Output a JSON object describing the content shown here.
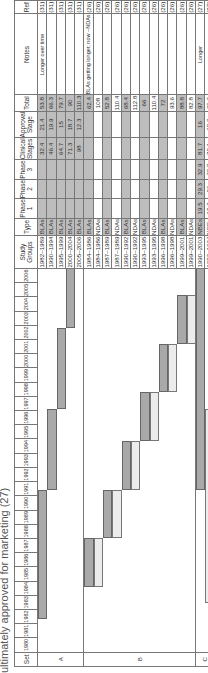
{
  "title": "ultimately approved for marketing (27)",
  "headers": {
    "set": "Set",
    "study_groups": "Study Groups",
    "type": "Type",
    "phase1": "Phase 1",
    "phase2": "Phase 2",
    "phase3": "Phase 3",
    "clinical": "Clinical Stages",
    "approval": "Approval Stage",
    "total": "Total",
    "notes": "Notes",
    "ref": "Ref"
  },
  "years": [
    "1980",
    "1981",
    "1982",
    "1983",
    "1984",
    "1985",
    "1986",
    "1987",
    "1988",
    "1989",
    "1990",
    "1991",
    "1992",
    "1993",
    "1994",
    "1995",
    "1996",
    "1997",
    "1998",
    "1999",
    "2000",
    "2001",
    "2002",
    "2003",
    "2004",
    "2005",
    "2006"
  ],
  "sets": [
    {
      "label": "A",
      "rows": 5
    },
    {
      "label": "B",
      "rows": 12
    },
    {
      "label": "C",
      "rows": 2
    }
  ],
  "rows": [
    {
      "set": "A",
      "group": "1982–1989",
      "type": "BLAs",
      "p1": "",
      "p2": "",
      "p3": "",
      "clinical": "32.4",
      "approval": "21.4",
      "total": "53.8",
      "notes": "Longer over time",
      "ref": "(31)",
      "shade": true
    },
    {
      "set": "A",
      "group": "1990–1994",
      "type": "BLAs",
      "p1": "",
      "p2": "",
      "p3": "",
      "clinical": "46.4",
      "approval": "19.9",
      "total": "66.3",
      "notes": "",
      "ref": "(31)",
      "shade": true
    },
    {
      "set": "A",
      "group": "1995–1999",
      "type": "BLAs",
      "p1": "",
      "p2": "",
      "p3": "",
      "clinical": "64.7",
      "approval": "15",
      "total": "79.7",
      "notes": "",
      "ref": "(31)",
      "shade": true
    },
    {
      "set": "A",
      "group": "2000–2004",
      "type": "BLAs",
      "p1": "",
      "p2": "",
      "p3": "",
      "clinical": "71.3",
      "approval": "18.7",
      "total": "90",
      "notes": "",
      "ref": "(31)",
      "shade": true
    },
    {
      "set": "A",
      "group": "2005–2006",
      "type": "BLAs",
      "p1": "",
      "p2": "",
      "p3": "",
      "clinical": "98",
      "approval": "12.3",
      "total": "110.3",
      "notes": "",
      "ref": "(31)",
      "shade": true
    },
    {
      "set": "B",
      "group": "1984–1986",
      "type": "BLAs",
      "p1": "",
      "p2": "",
      "p3": "",
      "clinical": "",
      "approval": "",
      "total": "62.4",
      "notes": "BLAs getting longer, now ~NDAs",
      "ref": "(26)",
      "shade": true
    },
    {
      "set": "B",
      "group": "1984–1986",
      "type": "NDAs",
      "p1": "",
      "p2": "",
      "p3": "",
      "clinical": "",
      "approval": "",
      "total": "108",
      "notes": "",
      "ref": "(26)",
      "shade": false
    },
    {
      "set": "B",
      "group": "1987–1989",
      "type": "BLAs",
      "p1": "",
      "p2": "",
      "p3": "",
      "clinical": "",
      "approval": "",
      "total": "52.8",
      "notes": "",
      "ref": "(26)",
      "shade": true
    },
    {
      "set": "B",
      "group": "1987–1989",
      "type": "NDAs",
      "p1": "",
      "p2": "",
      "p3": "",
      "clinical": "",
      "approval": "",
      "total": "110.4",
      "notes": "",
      "ref": "(26)",
      "shade": false
    },
    {
      "set": "B",
      "group": "1990–1992",
      "type": "BLAs",
      "p1": "",
      "p2": "",
      "p3": "",
      "clinical": "",
      "approval": "",
      "total": "68.4",
      "notes": "",
      "ref": "(26)",
      "shade": true
    },
    {
      "set": "B",
      "group": "1990–1992",
      "type": "NDAs",
      "p1": "",
      "p2": "",
      "p3": "",
      "clinical": "",
      "approval": "",
      "total": "112.8",
      "notes": "",
      "ref": "(26)",
      "shade": false
    },
    {
      "set": "B",
      "group": "1993–1995",
      "type": "BLAs",
      "p1": "",
      "p2": "",
      "p3": "",
      "clinical": "",
      "approval": "",
      "total": "66",
      "notes": "",
      "ref": "(26)",
      "shade": true
    },
    {
      "set": "B",
      "group": "1993–1995",
      "type": "NDAs",
      "p1": "",
      "p2": "",
      "p3": "",
      "clinical": "",
      "approval": "",
      "total": "110.4",
      "notes": "",
      "ref": "(26)",
      "shade": false
    },
    {
      "set": "B",
      "group": "1996–1998",
      "type": "BLAs",
      "p1": "",
      "p2": "",
      "p3": "",
      "clinical": "",
      "approval": "",
      "total": "72",
      "notes": "",
      "ref": "(26)",
      "shade": true
    },
    {
      "set": "B",
      "group": "1996–1998",
      "type": "NDAs",
      "p1": "",
      "p2": "",
      "p3": "",
      "clinical": "",
      "approval": "",
      "total": "93.6",
      "notes": "",
      "ref": "(26)",
      "shade": false
    },
    {
      "set": "B",
      "group": "1999–2001",
      "type": "BLAs",
      "p1": "",
      "p2": "",
      "p3": "",
      "clinical": "",
      "approval": "",
      "total": "88.8",
      "notes": "",
      "ref": "(26)",
      "shade": true
    },
    {
      "set": "B",
      "group": "1999–2001",
      "type": "NDAs",
      "p1": "",
      "p2": "",
      "p3": "",
      "clinical": "",
      "approval": "",
      "total": "82.8",
      "notes": "",
      "ref": "(26)",
      "shade": false
    },
    {
      "set": "C",
      "group": "1990–2003",
      "type": "NBEs",
      "p1": "19.5",
      "p2": "29.3",
      "p3": "32.9",
      "clinical": "81.7",
      "approval": "16",
      "total": "97.7",
      "notes": "Longer",
      "ref": "(27)",
      "shade": true
    },
    {
      "set": "C",
      "group": "1983–1994",
      "type": "NCEs",
      "p1": "12.3",
      "p2": "26",
      "p3": "33.8",
      "clinical": "72.1",
      "approval": "18.2",
      "total": "90.3",
      "notes": "",
      "ref": "(27)",
      "shade": false
    }
  ],
  "timeline_bars": [
    {
      "row": 0,
      "clinical": [
        1982,
        1990
      ],
      "approval": null
    },
    {
      "row": 1,
      "clinical": [
        1990,
        1995
      ],
      "approval": null
    },
    {
      "row": 2,
      "clinical": [
        1995,
        2000
      ],
      "approval": null
    },
    {
      "row": 3,
      "clinical": [
        2000,
        2005
      ],
      "approval": null
    },
    {
      "row": 4,
      "clinical": [
        2005,
        2007
      ],
      "approval": null
    },
    {
      "row": 5,
      "clinical": [
        1984,
        1987
      ],
      "approval": null
    },
    {
      "row": 6,
      "clinical": null,
      "approval": [
        1984,
        1987
      ]
    },
    {
      "row": 7,
      "clinical": [
        1987,
        1990
      ],
      "approval": null
    },
    {
      "row": 8,
      "clinical": null,
      "approval": [
        1987,
        1990
      ]
    },
    {
      "row": 9,
      "clinical": [
        1990,
        1993
      ],
      "approval": null
    },
    {
      "row": 10,
      "clinical": null,
      "approval": [
        1990,
        1993
      ]
    },
    {
      "row": 11,
      "clinical": [
        1993,
        1996
      ],
      "approval": null
    },
    {
      "row": 12,
      "clinical": null,
      "approval": [
        1993,
        1996
      ]
    },
    {
      "row": 13,
      "clinical": [
        1996,
        1999
      ],
      "approval": null
    },
    {
      "row": 14,
      "clinical": null,
      "approval": [
        1996,
        1999
      ]
    },
    {
      "row": 15,
      "clinical": [
        1999,
        2002
      ],
      "approval": null
    },
    {
      "row": 16,
      "clinical": null,
      "approval": [
        1999,
        2002
      ]
    },
    {
      "row": 17,
      "clinical": [
        1990,
        2004
      ],
      "approval": null
    },
    {
      "row": 18,
      "clinical": null,
      "approval": [
        1983,
        1995
      ]
    }
  ],
  "chart_data": {
    "type": "table",
    "title": "ultimately approved for marketing (27)",
    "columns": [
      "Set",
      "Study Groups",
      "Type",
      "Phase 1",
      "Phase 2",
      "Phase 3",
      "Clinical Stages",
      "Approval Stage",
      "Total",
      "Notes",
      "Ref"
    ],
    "rows": [
      [
        "A",
        "1982–1989",
        "BLAs",
        "",
        "",
        "",
        "32.4",
        "21.4",
        "53.8",
        "Longer over time",
        "(31)"
      ],
      [
        "A",
        "1990–1994",
        "BLAs",
        "",
        "",
        "",
        "46.4",
        "19.9",
        "66.3",
        "",
        "(31)"
      ],
      [
        "A",
        "1995–1999",
        "BLAs",
        "",
        "",
        "",
        "64.7",
        "15",
        "79.7",
        "",
        "(31)"
      ],
      [
        "A",
        "2000–2004",
        "BLAs",
        "",
        "",
        "",
        "71.3",
        "18.7",
        "90",
        "",
        "(31)"
      ],
      [
        "A",
        "2005–2006",
        "BLAs",
        "",
        "",
        "",
        "98",
        "12.3",
        "110.3",
        "",
        "(31)"
      ],
      [
        "B",
        "1984–1986",
        "BLAs",
        "",
        "",
        "",
        "",
        "",
        "62.4",
        "BLAs getting longer, now ~NDAs",
        "(26)"
      ],
      [
        "B",
        "1984–1986",
        "NDAs",
        "",
        "",
        "",
        "",
        "",
        "108",
        "",
        "(26)"
      ],
      [
        "B",
        "1987–1989",
        "BLAs",
        "",
        "",
        "",
        "",
        "",
        "52.8",
        "",
        "(26)"
      ],
      [
        "B",
        "1987–1989",
        "NDAs",
        "",
        "",
        "",
        "",
        "",
        "110.4",
        "",
        "(26)"
      ],
      [
        "B",
        "1990–1992",
        "BLAs",
        "",
        "",
        "",
        "",
        "",
        "68.4",
        "",
        "(26)"
      ],
      [
        "B",
        "1990–1992",
        "NDAs",
        "",
        "",
        "",
        "",
        "",
        "112.8",
        "",
        "(26)"
      ],
      [
        "B",
        "1993–1995",
        "BLAs",
        "",
        "",
        "",
        "",
        "",
        "66",
        "",
        "(26)"
      ],
      [
        "B",
        "1993–1995",
        "NDAs",
        "",
        "",
        "",
        "",
        "",
        "110.4",
        "",
        "(26)"
      ],
      [
        "B",
        "1996–1998",
        "BLAs",
        "",
        "",
        "",
        "",
        "",
        "72",
        "",
        "(26)"
      ],
      [
        "B",
        "1996–1998",
        "NDAs",
        "",
        "",
        "",
        "",
        "",
        "93.6",
        "",
        "(26)"
      ],
      [
        "B",
        "1999–2001",
        "BLAs",
        "",
        "",
        "",
        "",
        "",
        "88.8",
        "",
        "(26)"
      ],
      [
        "B",
        "1999–2001",
        "NDAs",
        "",
        "",
        "",
        "",
        "",
        "82.8",
        "",
        "(26)"
      ],
      [
        "C",
        "1990–2003",
        "NBEs",
        "19.5",
        "29.3",
        "32.9",
        "81.7",
        "16",
        "97.7",
        "Longer",
        "(27)"
      ],
      [
        "C",
        "1983–1994",
        "NCEs",
        "12.3",
        "26",
        "33.8",
        "72.1",
        "18.2",
        "90.3",
        "",
        "(27)"
      ]
    ],
    "timeline_axis": {
      "start": 1980,
      "end": 2006
    }
  }
}
